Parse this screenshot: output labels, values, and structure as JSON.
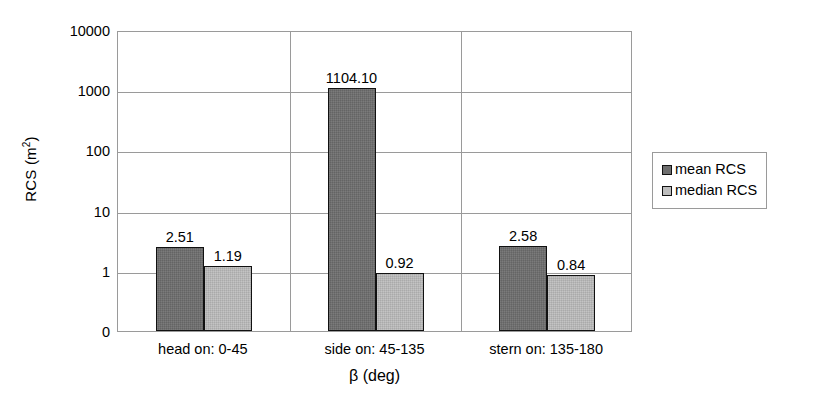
{
  "chart_data": {
    "type": "bar",
    "title": "",
    "xlabel": "β (deg)",
    "ylabel": "RCS (m²)",
    "ylabel_base": "RCS (m",
    "ylabel_sup": "2",
    "ylabel_tail": ")",
    "yscale": "log",
    "ylim": [
      0,
      10000
    ],
    "ytick_labels": [
      "10000",
      "1000",
      "100",
      "10",
      "1",
      "0"
    ],
    "grid": true,
    "legend_position": "right",
    "categories": [
      "head on:  0-45",
      "side on: 45-135",
      "stern on: 135-180"
    ],
    "series": [
      {
        "name": "mean RCS",
        "color": "#6e6e6e",
        "values": [
          2.51,
          1104.1,
          2.58
        ],
        "labels": [
          "2.51",
          "1104.10",
          "2.58"
        ]
      },
      {
        "name": "median RCS",
        "color": "#bdbdbd",
        "values": [
          1.19,
          0.92,
          0.84
        ],
        "labels": [
          "1.19",
          "0.92",
          "0.84"
        ]
      }
    ]
  },
  "legend": {
    "items": [
      {
        "label": "mean RCS",
        "color": "#6e6e6e"
      },
      {
        "label": "median RCS",
        "color": "#bdbdbd"
      }
    ]
  },
  "axis": {
    "y_title": "RCS (m2)",
    "x_title": "β (deg)",
    "y_ticks": [
      "10000",
      "1000",
      "100",
      "10",
      "1",
      "0"
    ],
    "x_ticks": [
      "head on:  0-45",
      "side on: 45-135",
      "stern on: 135-180"
    ]
  },
  "colors": {
    "mean": "#6e6e6e",
    "median": "#bdbdbd",
    "grid": "#9a9a9a",
    "bar_border": "#111111",
    "background": "#ffffff",
    "text": "#000000"
  }
}
